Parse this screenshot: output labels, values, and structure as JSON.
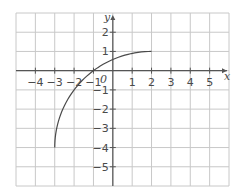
{
  "chart_data": {
    "type": "line",
    "title": "",
    "xlabel": "x",
    "ylabel": "y",
    "origin_label": "0",
    "xlim": [
      -5,
      6
    ],
    "ylim": [
      -6,
      3
    ],
    "grid": true,
    "x_ticks": [
      -4,
      -3,
      -2,
      -1,
      1,
      2,
      3,
      4,
      5
    ],
    "x_tick_labels": [
      "−4",
      "−3",
      "−2",
      "−1",
      "1",
      "2",
      "3",
      "4",
      "5"
    ],
    "y_ticks": [
      2,
      1,
      -1,
      -2,
      -3,
      -4,
      -5
    ],
    "y_tick_labels": [
      "2",
      "1",
      "−1",
      "−2",
      "−3",
      "−4",
      "−5"
    ],
    "series": [
      {
        "name": "curve",
        "description": "quarter circle arc, center (2,-4), radius 5",
        "x": [
          -3,
          -2.75,
          -2.5,
          -2,
          -1.5,
          -1,
          -0.5,
          0,
          0.5,
          1,
          1.5,
          2
        ],
        "y": [
          -4,
          -2.44,
          -1.82,
          -1,
          -0.43,
          0,
          0.33,
          0.58,
          0.77,
          0.9,
          0.97,
          1
        ]
      }
    ],
    "colors": {
      "grid": "#c8c8c8",
      "axis": "#555555",
      "curve": "#4a4a4a"
    }
  }
}
